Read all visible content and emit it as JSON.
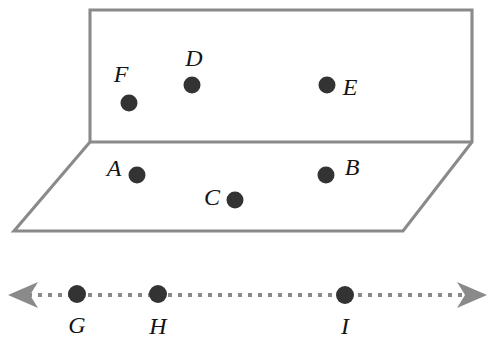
{
  "figure": {
    "canvas": {
      "width": 502,
      "height": 348,
      "background": "#ffffff"
    },
    "colors": {
      "plane_edge": "#8a8a8a",
      "plane_face": "#ffffff",
      "point_dot": "#333333",
      "label_text": "#141414",
      "axis_line": "#8a8a8a",
      "axis_arrow": "#8a8a8a"
    },
    "plane": {
      "name": "plane",
      "description": "Plane drawn in perspective as an upper rectangle joined to a lower parallelogram along a shared horizontal fold line",
      "upper_face_points": "90,10 472,10 472,142 90,142",
      "lower_face_points": "90,142 472,142 403,231 14,231",
      "outline_points": "90,10 472,10 472,142 403,231 14,231 90,142",
      "fold_line": {
        "x1": 90,
        "y1": 142,
        "x2": 472,
        "y2": 142
      }
    },
    "plane_points": [
      {
        "id": "F",
        "label": "F",
        "dot_x": 129,
        "dot_y": 103,
        "r": 8.5,
        "label_x": 121,
        "label_y": 82
      },
      {
        "id": "D",
        "label": "D",
        "dot_x": 192,
        "dot_y": 85,
        "r": 8.5,
        "label_x": 194,
        "label_y": 66
      },
      {
        "id": "E",
        "label": "E",
        "dot_x": 327,
        "dot_y": 85,
        "r": 8.5,
        "label_x": 350,
        "label_y": 95
      },
      {
        "id": "A",
        "label": "A",
        "dot_x": 137,
        "dot_y": 175,
        "r": 8.5,
        "label_x": 114,
        "label_y": 176
      },
      {
        "id": "B",
        "label": "B",
        "dot_x": 326,
        "dot_y": 175,
        "r": 8.5,
        "label_x": 352,
        "label_y": 175
      },
      {
        "id": "C",
        "label": "C",
        "dot_x": 235,
        "dot_y": 200,
        "r": 8.5,
        "label_x": 212,
        "label_y": 205
      }
    ],
    "line": {
      "name": "dashed-line",
      "description": "Horizontal dotted line with arrowheads on both ends",
      "y": 295,
      "x_start": 18,
      "x_end": 478,
      "left_arrow_points": "8,295 38,282 30,295 38,308",
      "right_arrow_points": "487,295 457,282 465,295 457,308"
    },
    "line_points": [
      {
        "id": "G",
        "label": "G",
        "dot_x": 77,
        "dot_y": 294,
        "r": 9,
        "label_x": 77,
        "label_y": 333
      },
      {
        "id": "H",
        "label": "H",
        "dot_x": 158,
        "dot_y": 294,
        "r": 9,
        "label_x": 158,
        "label_y": 334
      },
      {
        "id": "I",
        "label": "I",
        "dot_x": 345,
        "dot_y": 295,
        "r": 9,
        "label_x": 345,
        "label_y": 334
      }
    ]
  }
}
